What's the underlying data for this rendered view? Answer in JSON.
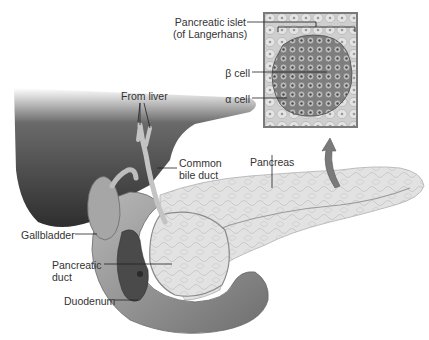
{
  "figure": {
    "labels": {
      "islet_line1": "Pancreatic islet",
      "islet_line2": "(of Langerhans)",
      "beta_cell": "β cell",
      "alpha_cell": "α cell",
      "from_liver": "From liver",
      "common_bile_duct_line1": "Common",
      "common_bile_duct_line2": "bile duct",
      "pancreas": "Pancreas",
      "gallbladder": "Gallbladder",
      "pancreatic_duct_line1": "Pancreatic",
      "pancreatic_duct_line2": "duct",
      "duodenum": "Duodenum"
    },
    "colors": {
      "liver": "#3d3d3d",
      "pancreas": "#dcdcdc",
      "duodenum": "#9a9a9a",
      "inset_border": "#7a7a7a",
      "islet": "#8a8a8a",
      "label_text": "#333333"
    }
  }
}
